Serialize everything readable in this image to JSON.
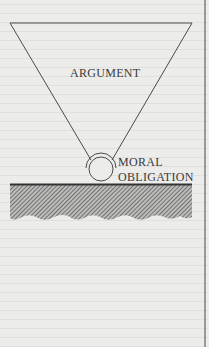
{
  "diagram": {
    "labels": {
      "argument": "ARGUMENT",
      "moral_line1": "MORAL",
      "moral_line2": "OBLIGATION"
    },
    "shapes": {
      "inverted_triangle": {
        "top_y": 23,
        "left_x": 10,
        "right_x": 192,
        "apex_x": 101,
        "apex_y": 160
      },
      "circle": {
        "cx": 101,
        "cy": 168,
        "r": 12
      },
      "ground_line": {
        "y": 184,
        "x1": 10,
        "x2": 192
      },
      "hatched_ground": {
        "top_y": 185,
        "bottom_y": 222
      }
    },
    "colors": {
      "background": "#ececeb",
      "line": "#4a4a4a",
      "text": "#3a3a3a",
      "hatch": "#6e6e6e",
      "border": "#9a9a9a"
    }
  }
}
